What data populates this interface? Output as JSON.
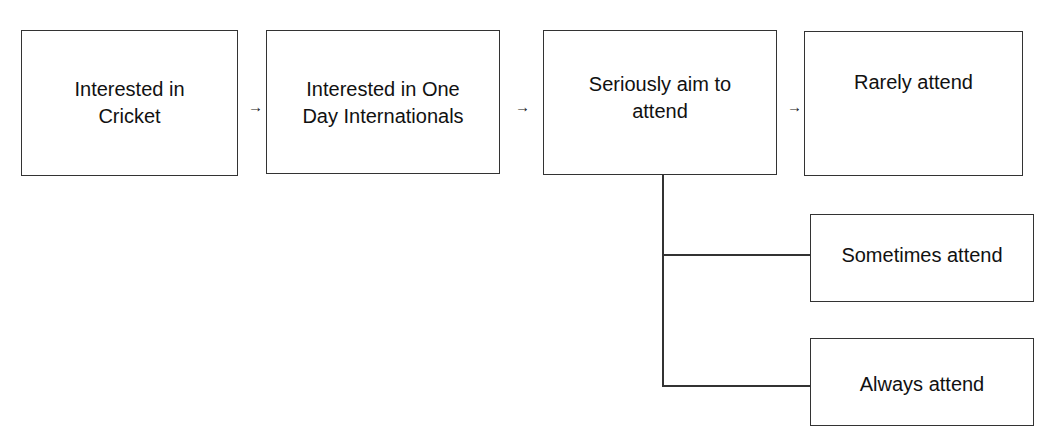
{
  "diagram": {
    "type": "flowchart",
    "nodes": [
      {
        "id": "interested-cricket",
        "label": "Interested in\nCricket"
      },
      {
        "id": "interested-odi",
        "label": "Interested in One\nDay Internationals"
      },
      {
        "id": "seriously-aim",
        "label": "Seriously aim to\nattend"
      },
      {
        "id": "rarely-attend",
        "label": "Rarely attend"
      },
      {
        "id": "sometimes-attend",
        "label": "Sometimes attend"
      },
      {
        "id": "always-attend",
        "label": "Always attend"
      }
    ],
    "arrow_glyph": "→",
    "edges": [
      {
        "from": "interested-cricket",
        "to": "interested-odi",
        "style": "arrow"
      },
      {
        "from": "interested-odi",
        "to": "seriously-aim",
        "style": "arrow"
      },
      {
        "from": "seriously-aim",
        "to": "rarely-attend",
        "style": "arrow"
      },
      {
        "from": "seriously-aim",
        "to": "sometimes-attend",
        "style": "elbow-line"
      },
      {
        "from": "seriously-aim",
        "to": "always-attend",
        "style": "elbow-line"
      }
    ]
  }
}
